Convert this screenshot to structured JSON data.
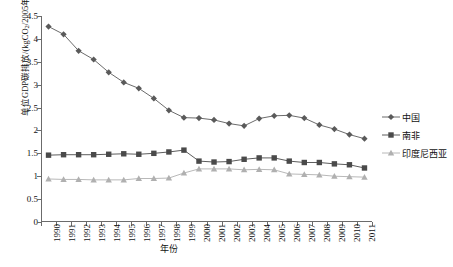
{
  "chart_data": {
    "type": "line",
    "title": "",
    "xlabel": "年份",
    "ylabel": "单位GDP碳排放/(kgCO₂/2005年美元)",
    "ylabel_main": "单位GDP碳排放/(kgCO",
    "ylabel_sub": "2",
    "ylabel_tail": "/2005年美元)",
    "x": [
      1990,
      1991,
      1992,
      1993,
      1994,
      1995,
      1996,
      1997,
      1998,
      1999,
      2000,
      2001,
      2002,
      2003,
      2004,
      2005,
      2006,
      2007,
      2008,
      2009,
      2010,
      2011
    ],
    "categories": [
      "1990",
      "1991",
      "1992",
      "1993",
      "1994",
      "1995",
      "1996",
      "1997",
      "1998",
      "1999",
      "2000",
      "2001",
      "2002",
      "2003",
      "2004",
      "2005",
      "2006",
      "2007",
      "2008",
      "2009",
      "2010",
      "2011"
    ],
    "ylim": [
      0,
      4.5
    ],
    "yticks": [
      0,
      0.5,
      1,
      1.5,
      2,
      2.5,
      3,
      3.5,
      4,
      4.5
    ],
    "ytick_labels": [
      "0",
      "0.5",
      "1",
      "1.5",
      "2",
      "2.5",
      "3",
      "3.5",
      "4",
      "4.5"
    ],
    "grid": false,
    "legend_position": "right",
    "series": [
      {
        "name": "中国",
        "marker": "diamond",
        "color": "#5a5a5a",
        "values": [
          4.27,
          4.1,
          3.74,
          3.55,
          3.27,
          3.05,
          2.92,
          2.7,
          2.44,
          2.28,
          2.27,
          2.23,
          2.15,
          2.1,
          2.26,
          2.32,
          2.33,
          2.27,
          2.12,
          2.03,
          1.91,
          1.82
        ]
      },
      {
        "name": "南非",
        "marker": "square",
        "color": "#4a4a4a",
        "values": [
          1.46,
          1.47,
          1.47,
          1.47,
          1.48,
          1.49,
          1.48,
          1.5,
          1.53,
          1.57,
          1.33,
          1.31,
          1.32,
          1.37,
          1.4,
          1.4,
          1.33,
          1.3,
          1.3,
          1.27,
          1.25,
          1.18
        ]
      },
      {
        "name": "印度尼西亚",
        "marker": "triangle",
        "color": "#b0b0b0",
        "values": [
          0.94,
          0.93,
          0.93,
          0.92,
          0.92,
          0.92,
          0.95,
          0.95,
          0.96,
          1.07,
          1.16,
          1.16,
          1.16,
          1.14,
          1.15,
          1.14,
          1.05,
          1.04,
          1.03,
          1.0,
          0.99,
          0.98
        ]
      }
    ]
  }
}
